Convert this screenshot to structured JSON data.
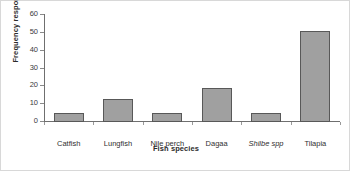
{
  "chart_data": {
    "type": "bar",
    "title": "",
    "xlabel": "Fish species",
    "ylabel": "Frequency response",
    "categories": [
      "Catfish",
      "Lungfish",
      "Nile perch",
      "Dagaa",
      "Shilbe spp",
      "Tilapia"
    ],
    "categories_italic": [
      false,
      false,
      false,
      false,
      true,
      false
    ],
    "values": [
      5,
      13,
      5,
      19,
      5,
      51
    ],
    "ylim": [
      0,
      60
    ],
    "yticks": [
      0,
      10,
      20,
      30,
      40,
      50,
      60
    ],
    "ytick_labels": [
      "0",
      "10",
      "20",
      "30",
      "40",
      "50",
      "60"
    ],
    "grid": false,
    "legend": false,
    "bar_color": "#a0a0a0",
    "bar_edge_color": "#585858",
    "axis_color": "#6f6f6f"
  }
}
